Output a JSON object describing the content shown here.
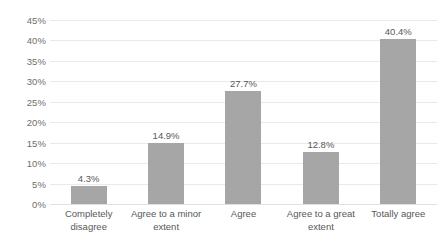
{
  "chart_data": {
    "type": "bar",
    "title": "",
    "subtitle": "",
    "xlabel": "",
    "ylabel": "",
    "categories": [
      "Completely disagree",
      "Agree to a minor extent",
      "Agree",
      "Agree to a great extent",
      "Totally agree"
    ],
    "category_lines": [
      [
        "Completely",
        "disagree"
      ],
      [
        "Agree to a minor",
        "extent"
      ],
      [
        "Agree"
      ],
      [
        "Agree to a great",
        "extent"
      ],
      [
        "Totally agree"
      ]
    ],
    "values": [
      4.3,
      14.9,
      27.7,
      12.8,
      40.4
    ],
    "data_labels": [
      "4.3%",
      "14.9%",
      "27.7%",
      "12.8%",
      "40.4%"
    ],
    "ylim": [
      0,
      45
    ],
    "ytick_values": [
      0,
      5,
      10,
      15,
      20,
      25,
      30,
      35,
      40,
      45
    ],
    "ytick_labels": [
      "0%",
      "5%",
      "10%",
      "15%",
      "20%",
      "25%",
      "30%",
      "35%",
      "40%",
      "45%"
    ],
    "grid": true,
    "legend": "none",
    "colors": {
      "bar_fill": "#a6a6a6",
      "gridline": "#e9e9e9",
      "axis_text": "#6e6e6e",
      "label_text": "#585858",
      "background": "#ffffff"
    }
  }
}
